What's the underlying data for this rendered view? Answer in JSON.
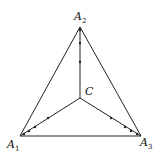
{
  "diagram": {
    "labels": {
      "a1": {
        "base": "A",
        "sub": "1"
      },
      "a2": {
        "base": "A",
        "sub": "2"
      },
      "a3": {
        "base": "A",
        "sub": "3"
      },
      "c": "C"
    },
    "stroke_color": "#222222",
    "vertices": {
      "A1": [
        20,
        136
      ],
      "A2": [
        80,
        27
      ],
      "A3": [
        141,
        136
      ],
      "C": [
        80,
        98
      ]
    },
    "path_dots": {
      "C_A2": [
        [
          80,
          29
        ],
        [
          80,
          43
        ],
        [
          80,
          62
        ]
      ],
      "C_A1": [
        [
          48,
          119
        ],
        [
          35,
          128
        ],
        [
          28,
          132
        ],
        [
          23,
          134
        ]
      ],
      "C_A3": [
        [
          111,
          118
        ],
        [
          125,
          127
        ],
        [
          132,
          131
        ],
        [
          138,
          134
        ]
      ]
    }
  }
}
